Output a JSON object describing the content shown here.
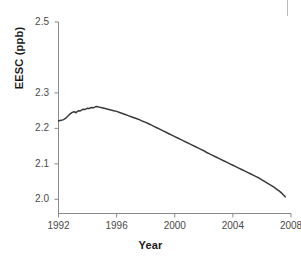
{
  "figure": {
    "name": "eesc-time-series-figure",
    "background": "#ffffff",
    "line_color": "#3b3b3b",
    "axis_color": "#8a8a8a",
    "text_color": "#4a4a4a",
    "title_color": "#1a1a1a"
  },
  "chart_data": {
    "type": "line",
    "title": "",
    "xlabel": "Year",
    "ylabel": "EESC (ppb)",
    "xlim": [
      1992,
      2008
    ],
    "ylim": [
      1.96,
      2.5
    ],
    "grid": false,
    "legend": null,
    "xticks": [
      1992,
      1996,
      2000,
      2004,
      2008
    ],
    "xtick_labels": [
      "1992",
      "1996",
      "2000",
      "2004",
      "2008"
    ],
    "yticks": [
      2.0,
      2.1,
      2.2,
      2.3,
      2.5
    ],
    "ytick_labels": [
      "2.0",
      "2.1",
      "2.2",
      "2.3",
      "2.5"
    ],
    "series": [
      {
        "name": "EESC",
        "color": "#3b3b3b",
        "x": [
          1992.0,
          1992.1,
          1992.2,
          1992.3,
          1992.4,
          1992.5,
          1992.6,
          1992.7,
          1992.8,
          1992.9,
          1993.0,
          1993.1,
          1993.2,
          1993.3,
          1993.4,
          1993.5,
          1993.6,
          1993.7,
          1993.8,
          1993.9,
          1994.0,
          1994.1,
          1994.2,
          1994.3,
          1994.4,
          1994.5,
          1994.6,
          1994.7,
          1994.8,
          1994.9,
          1995.0,
          1995.2,
          1995.4,
          1995.6,
          1995.8,
          1996.0,
          1996.2,
          1996.4,
          1996.6,
          1996.8,
          1997.0,
          1997.2,
          1997.4,
          1997.6,
          1997.8,
          1998.0,
          1998.2,
          1998.4,
          1998.6,
          1998.8,
          1999.0,
          1999.2,
          1999.4,
          1999.6,
          1999.8,
          2000.0,
          2000.2,
          2000.4,
          2000.6,
          2000.8,
          2001.0,
          2001.2,
          2001.4,
          2001.6,
          2001.8,
          2002.0,
          2002.2,
          2002.4,
          2002.6,
          2002.8,
          2003.0,
          2003.2,
          2003.4,
          2003.6,
          2003.8,
          2004.0,
          2004.2,
          2004.4,
          2004.6,
          2004.8,
          2005.0,
          2005.2,
          2005.4,
          2005.6,
          2005.8,
          2006.0,
          2006.2,
          2006.4,
          2006.6,
          2006.8,
          2007.0,
          2007.2,
          2007.4,
          2007.6
        ],
        "y": [
          2.221,
          2.222,
          2.223,
          2.224,
          2.226,
          2.229,
          2.233,
          2.237,
          2.241,
          2.244,
          2.246,
          2.247,
          2.244,
          2.248,
          2.25,
          2.249,
          2.252,
          2.254,
          2.253,
          2.255,
          2.257,
          2.256,
          2.258,
          2.259,
          2.258,
          2.26,
          2.262,
          2.261,
          2.26,
          2.259,
          2.258,
          2.256,
          2.254,
          2.252,
          2.25,
          2.248,
          2.245,
          2.242,
          2.239,
          2.236,
          2.233,
          2.23,
          2.227,
          2.224,
          2.22,
          2.217,
          2.213,
          2.209,
          2.205,
          2.201,
          2.197,
          2.193,
          2.189,
          2.185,
          2.181,
          2.177,
          2.173,
          2.169,
          2.165,
          2.161,
          2.157,
          2.153,
          2.149,
          2.145,
          2.141,
          2.137,
          2.132,
          2.128,
          2.124,
          2.12,
          2.116,
          2.112,
          2.108,
          2.104,
          2.1,
          2.096,
          2.092,
          2.088,
          2.084,
          2.08,
          2.076,
          2.072,
          2.068,
          2.064,
          2.06,
          2.055,
          2.05,
          2.045,
          2.04,
          2.035,
          2.029,
          2.023,
          2.016,
          2.007
        ]
      }
    ]
  }
}
